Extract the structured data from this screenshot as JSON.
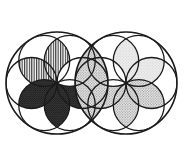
{
  "figure": {
    "title": "Two overlapping rosette circles",
    "canvas": {
      "width": 188,
      "height": 141,
      "background_color": "#ffffff"
    },
    "stroke": {
      "color": "#1a1a1a",
      "outer_width": 1.6,
      "inner_width": 1.3
    },
    "fills": {
      "white": "#ffffff",
      "very_light_gray": "#efefef",
      "light_gray": "#e2e2e2",
      "mid_gray": "#b9b9b9",
      "dark_gray": "#4a4a4a",
      "near_black": "#2b2b2b"
    },
    "circles": [
      {
        "name": "left-main-circle",
        "cx": 57,
        "cy": 83,
        "r": 51
      },
      {
        "name": "right-main-circle",
        "cx": 126,
        "cy": 83,
        "r": 51
      }
    ],
    "petal_count_per_circle": 6,
    "left_circle_petals": [
      {
        "index": 0,
        "position": "top-left",
        "fill_pattern": "vertical-stripes",
        "tone": "dark"
      },
      {
        "index": 1,
        "position": "top",
        "fill_pattern": "vertical-stripes",
        "tone": "dark"
      },
      {
        "index": 2,
        "position": "top-right",
        "fill_pattern": "none",
        "tone": "white"
      },
      {
        "index": 3,
        "position": "bottom-right",
        "fill_pattern": "dense-stipple",
        "tone": "near-black"
      },
      {
        "index": 4,
        "position": "bottom",
        "fill_pattern": "dense-stipple",
        "tone": "near-black"
      },
      {
        "index": 5,
        "position": "bottom-left",
        "fill_pattern": "dense-stipple",
        "tone": "near-black"
      }
    ],
    "right_circle_petals": [
      {
        "index": 0,
        "position": "top",
        "fill_pattern": "light-stipple",
        "tone": "light"
      },
      {
        "index": 1,
        "position": "top-right",
        "fill_pattern": "light-stipple",
        "tone": "light"
      },
      {
        "index": 2,
        "position": "right",
        "fill_pattern": "medium-stipple",
        "tone": "medium"
      },
      {
        "index": 3,
        "position": "bottom-right",
        "fill_pattern": "medium-stipple",
        "tone": "medium"
      },
      {
        "index": 4,
        "position": "bottom",
        "fill_pattern": "medium-stipple",
        "tone": "medium"
      },
      {
        "index": 5,
        "position": "left",
        "fill_pattern": "medium-stipple",
        "tone": "medium"
      }
    ],
    "overlap_region": {
      "name": "central-lens",
      "fill_pattern": "medium-stipple",
      "tone": "medium"
    }
  }
}
